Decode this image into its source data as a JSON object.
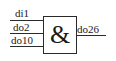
{
  "gate": {
    "type": "AND",
    "symbol": "&",
    "inputs": [
      {
        "label": "di1"
      },
      {
        "label": "do2"
      },
      {
        "label": "do10"
      }
    ],
    "output": {
      "label": "do26"
    }
  }
}
